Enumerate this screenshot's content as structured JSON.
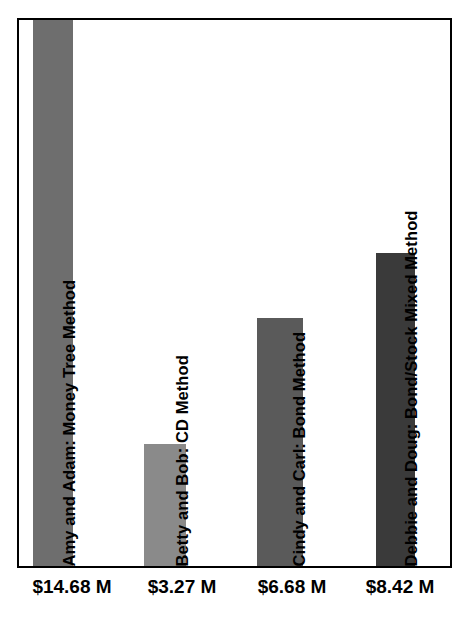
{
  "chart_data": {
    "type": "bar",
    "title": "",
    "subtitle": "",
    "xlabel": "",
    "ylabel": "",
    "grid": false,
    "legend": "none",
    "orientation": "vertical",
    "ylim": [
      0,
      14.68
    ],
    "value_unit": "millions of dollars",
    "categories": [
      "Amy and Adam: Money Tree Method",
      "Betty and Bob: CD Method",
      "Cindy and Carl: Bond Method",
      "Debbie and Doug: Bond/Stock Mixed Method"
    ],
    "values": [
      14.68,
      3.27,
      6.68,
      8.42
    ],
    "value_labels": [
      "$14.68 M",
      "$3.27 M",
      "$6.68 M",
      "$8.42 M"
    ],
    "bar_colors": [
      "#6e6e6e",
      "#8a8a8a",
      "#5a5a5a",
      "#3a3a3a"
    ],
    "frame_color": "#000000",
    "background_color": "#ffffff"
  },
  "bars": [
    {
      "label": "Amy and Adam: Money Tree Method",
      "value_label": "$14.68 M",
      "value": 14.68,
      "color": "#6e6e6e"
    },
    {
      "label": "Betty and Bob: CD Method",
      "value_label": "$3.27 M",
      "value": 3.27,
      "color": "#8a8a8a"
    },
    {
      "label": "Cindy and Carl: Bond Method",
      "value_label": "$6.68 M",
      "value": 6.68,
      "color": "#5a5a5a"
    },
    {
      "label": "Debbie and Doug: Bond/Stock Mixed Method",
      "value_label": "$8.42 M",
      "value": 8.42,
      "color": "#3a3a3a"
    }
  ]
}
